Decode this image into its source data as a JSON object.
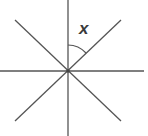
{
  "diagram": {
    "type": "intersecting-lines",
    "center": [
      68,
      70
    ],
    "lines": [
      {
        "name": "vertical",
        "from": [
          68,
          0
        ],
        "to": [
          68,
          136
        ]
      },
      {
        "name": "horizontal",
        "from": [
          0,
          71
        ],
        "to": [
          144,
          71
        ]
      },
      {
        "name": "diagonal-up",
        "from": [
          15,
          121
        ],
        "to": [
          121,
          20
        ]
      },
      {
        "name": "diagonal-down",
        "from": [
          15,
          20
        ],
        "to": [
          121,
          121
        ]
      }
    ],
    "angle_label": "x",
    "colors": {
      "line": "#555555",
      "background": "#ffffff"
    }
  }
}
